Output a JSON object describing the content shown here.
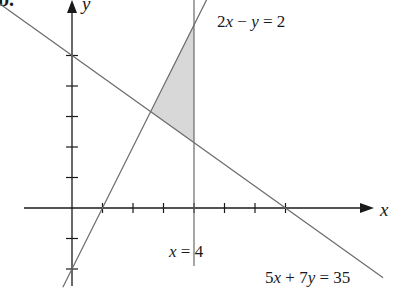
{
  "figure": {
    "part_label": "b.",
    "axis_labels": {
      "x": "x",
      "y": "y"
    },
    "origin_px": [
      72,
      208
    ],
    "unit_px": 30.5,
    "x_ticks": [
      1,
      2,
      3,
      4,
      5,
      6,
      7
    ],
    "y_ticks": [
      -2,
      -1,
      1,
      2,
      3,
      4,
      5
    ],
    "lines": [
      {
        "id": "line-5x7y",
        "equation": "5x + 7y = 35",
        "label_parts": [
          "5",
          "x",
          " + 7",
          "y",
          " = 35"
        ],
        "from": [
          -3.0,
          7.143
        ],
        "to": [
          10.2,
          -2.286
        ]
      },
      {
        "id": "line-2xy",
        "equation": "2x − y = 2",
        "label_parts": [
          "2",
          "x",
          " − ",
          "y",
          " = 2"
        ],
        "from": [
          -0.3,
          -2.6
        ],
        "to": [
          5.3,
          8.6
        ]
      },
      {
        "id": "line-x4",
        "equation": "x = 4",
        "label_parts": [
          "x",
          " = 4"
        ],
        "from": [
          4,
          6.95
        ],
        "to": [
          4,
          -1.9
        ]
      }
    ],
    "shaded_region": {
      "vertices": [
        [
          4,
          6
        ],
        [
          4,
          2.143
        ],
        [
          2.579,
          3.158
        ]
      ],
      "fill": "#d8d8d8"
    },
    "colors": {
      "axis": "#1a1a1a",
      "line": "#6a6a6a",
      "shade": "#d8d8d8",
      "text": "#1a1a1a"
    }
  }
}
